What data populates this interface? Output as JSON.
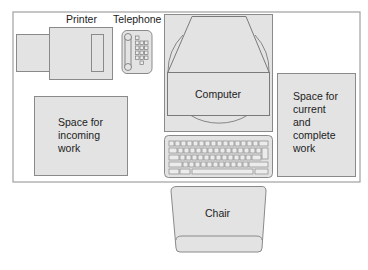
{
  "diagram": {
    "colors": {
      "fill": "#e3e3e3",
      "stroke": "#8a8a8a",
      "desk_stroke": "#9a9a9a",
      "text": "#222222",
      "background": "#ffffff"
    },
    "labels": {
      "printer": "Printer",
      "telephone": "Telephone",
      "computer": "Computer",
      "incoming": "Space for\nincoming\nwork",
      "current": "Space for\ncurrent\nand\ncomplete\nwork",
      "chair": "Chair"
    },
    "items": [
      {
        "id": "desk",
        "label": ""
      },
      {
        "id": "printer",
        "label": "Printer"
      },
      {
        "id": "telephone",
        "label": "Telephone"
      },
      {
        "id": "computer",
        "label": "Computer"
      },
      {
        "id": "keyboard",
        "label": ""
      },
      {
        "id": "incoming-work-space",
        "label": "Space for incoming work"
      },
      {
        "id": "current-complete-work-space",
        "label": "Space for current and complete work"
      },
      {
        "id": "chair",
        "label": "Chair"
      }
    ]
  }
}
